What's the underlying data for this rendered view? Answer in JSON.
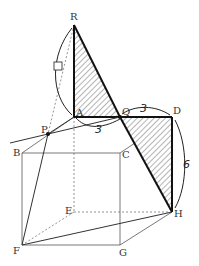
{
  "diagram": {
    "type": "geometry-cube-unfolding",
    "points": {
      "R": {
        "label": "R",
        "x": 74,
        "y": 25
      },
      "A": {
        "label": "A",
        "x": 74,
        "y": 117
      },
      "Q": {
        "label": "Q",
        "x": 120,
        "y": 117
      },
      "D": {
        "label": "D",
        "x": 172,
        "y": 117
      },
      "P": {
        "label": "P",
        "x": 48,
        "y": 134
      },
      "B": {
        "label": "B",
        "x": 22,
        "y": 153
      },
      "C": {
        "label": "C",
        "x": 120,
        "y": 153
      },
      "E": {
        "label": "E",
        "x": 74,
        "y": 212
      },
      "H": {
        "label": "H",
        "x": 172,
        "y": 212
      },
      "F": {
        "label": "F",
        "x": 22,
        "y": 245
      },
      "G": {
        "label": "G",
        "x": 120,
        "y": 245
      }
    },
    "annotations": {
      "qd_length": "3",
      "aq_length": "3",
      "dh_length": "6",
      "ra_length": "□"
    },
    "shaded_triangles": [
      "RAQ",
      "QDH"
    ]
  }
}
